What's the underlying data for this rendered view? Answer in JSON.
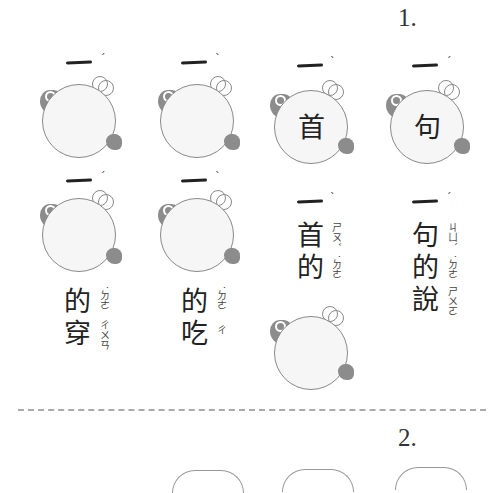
{
  "section1": {
    "number": "1.",
    "items": [
      {
        "prefix": "一",
        "tone": "ˊ",
        "bubble_text": "",
        "answer_lines": []
      },
      {
        "prefix": "一",
        "tone": "ˋ",
        "bubble_text": "",
        "answer_lines": []
      },
      {
        "prefix": "一",
        "tone": "ˋ",
        "bubble_text": "首",
        "answer_lines": []
      },
      {
        "prefix": "一",
        "tone": "ˊ",
        "bubble_text": "句",
        "answer_lines": []
      }
    ],
    "row2": [
      {
        "prefix": "一",
        "tone": "ˊ",
        "lines": [
          {
            "char": "的",
            "zhuyin": "˙ㄉㄜ"
          },
          {
            "char": "穿",
            "zhuyin": "ㄔㄨㄢ"
          }
        ]
      },
      {
        "prefix": "一",
        "tone": "ˋ",
        "lines": [
          {
            "char": "的",
            "zhuyin": "˙ㄉㄜ"
          },
          {
            "char": "吃",
            "zhuyin": "ㄔ"
          }
        ]
      },
      {
        "prefix": "一",
        "tone": "ˋ",
        "lines": [
          {
            "char": "首",
            "zhuyin": "ㄕㄡˇ"
          },
          {
            "char": "的",
            "zhuyin": "˙ㄉㄜ"
          }
        ]
      },
      {
        "prefix": "一",
        "tone": "ˊ",
        "lines": [
          {
            "char": "句",
            "zhuyin": "ㄐㄩˋ"
          },
          {
            "char": "的",
            "zhuyin": "˙ㄉㄜ"
          },
          {
            "char": "說",
            "zhuyin": "ㄕㄨㄛ"
          }
        ]
      }
    ]
  },
  "section2": {
    "number": "2."
  }
}
